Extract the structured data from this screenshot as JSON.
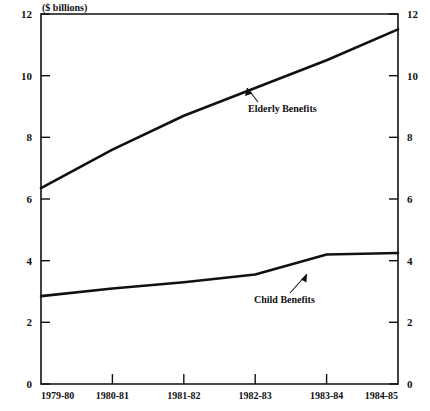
{
  "chart_data": {
    "type": "line",
    "title": "($ billions)",
    "xlabel": "",
    "ylabel": "($ billions)",
    "ylim": [
      0,
      12
    ],
    "yticks": [
      0,
      2,
      4,
      6,
      8,
      10,
      12
    ],
    "ytick_labels": [
      "0",
      "2",
      "4",
      "6",
      "8",
      "10",
      "12"
    ],
    "right_axis": {
      "visible": true,
      "ticks": [
        0,
        2,
        4,
        6,
        8,
        10,
        12
      ],
      "tick_labels": [
        "0",
        "2",
        "4",
        "6",
        "8",
        "10",
        "12"
      ]
    },
    "grid": false,
    "legend_position": "inline-annotations",
    "categories": [
      "1979-80",
      "1980-81",
      "1981-82",
      "1982-83",
      "1983-84",
      "1984-85"
    ],
    "x": [
      "1979-80",
      "1980-81",
      "1981-82",
      "1982-83",
      "1983-84",
      "1984-85"
    ],
    "series": [
      {
        "name": "Elderly Benefits",
        "values": [
          6.35,
          7.6,
          8.7,
          9.6,
          10.5,
          11.5
        ],
        "annotation": "Elderly Benefits"
      },
      {
        "name": "Child Benefits",
        "values": [
          2.85,
          3.1,
          3.3,
          3.55,
          4.2,
          4.25
        ],
        "annotation": "Child Benefits"
      }
    ],
    "annotations": [
      {
        "text": "Elderly Benefits",
        "series": "Elderly Benefits"
      },
      {
        "text": "Child Benefits",
        "series": "Child Benefits"
      }
    ],
    "colors": {
      "line": "#111111",
      "axis": "#111111",
      "background": "#ffffff"
    }
  },
  "axes": {
    "unit_label": "($ billions)",
    "y_left_labels": [
      "12",
      "10",
      "8",
      "6",
      "4",
      "2",
      "0"
    ],
    "y_right_labels": [
      "12",
      "10",
      "8",
      "6",
      "4",
      "2",
      "0"
    ],
    "x_labels": [
      "1979-80",
      "1980-81",
      "1981-82",
      "1982-83",
      "1983-84",
      "1984-85"
    ]
  },
  "series_labels": {
    "elderly": "Elderly Benefits",
    "child": "Child Benefits"
  }
}
